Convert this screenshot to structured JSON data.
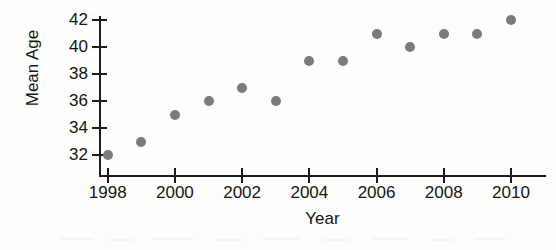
{
  "figure": {
    "background_color": "#fdfdfc",
    "axis_color": "#1c1c1c",
    "point_color": "#7b7b7b",
    "width": 556,
    "height": 250
  },
  "chart_data": {
    "type": "scatter",
    "title": "",
    "xlabel": "Year",
    "ylabel": "Mean Age",
    "xlim": [
      1998,
      2010
    ],
    "ylim": [
      32,
      42
    ],
    "grid": false,
    "legend": null,
    "x": [
      1998,
      1999,
      2000,
      2001,
      2002,
      2003,
      2004,
      2005,
      2006,
      2007,
      2008,
      2009,
      2010
    ],
    "values": [
      32,
      33,
      35,
      36,
      37,
      36,
      39,
      39,
      41,
      40,
      41,
      41,
      42
    ],
    "points": [
      {
        "year": 1998,
        "mean_age": 32
      },
      {
        "year": 1999,
        "mean_age": 33
      },
      {
        "year": 2000,
        "mean_age": 35
      },
      {
        "year": 2001,
        "mean_age": 36
      },
      {
        "year": 2002,
        "mean_age": 37
      },
      {
        "year": 2003,
        "mean_age": 36
      },
      {
        "year": 2004,
        "mean_age": 39
      },
      {
        "year": 2005,
        "mean_age": 39
      },
      {
        "year": 2006,
        "mean_age": 41
      },
      {
        "year": 2007,
        "mean_age": 40
      },
      {
        "year": 2008,
        "mean_age": 41
      },
      {
        "year": 2009,
        "mean_age": 41
      },
      {
        "year": 2010,
        "mean_age": 42
      }
    ],
    "x_ticks": [
      1998,
      2000,
      2002,
      2004,
      2006,
      2008,
      2010
    ],
    "x_tick_labels": [
      "1998",
      "2000",
      "2002",
      "2004",
      "2006",
      "2008",
      "2010"
    ],
    "y_ticks": [
      32,
      34,
      36,
      38,
      40,
      42
    ],
    "y_tick_labels": [
      "32",
      "34",
      "36",
      "38",
      "40",
      "42"
    ]
  }
}
